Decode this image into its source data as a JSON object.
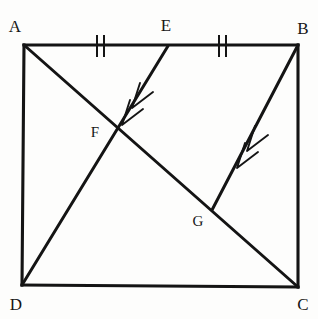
{
  "figure": {
    "type": "euclidean-geometry-diagram",
    "canvas": {
      "width": 318,
      "height": 319
    },
    "background_color": "#fdfdfc",
    "ink_color": "#141414",
    "vertices": [
      {
        "name": "A",
        "label": "A",
        "x": 24,
        "y": 45,
        "label_x": 15,
        "label_y": 32
      },
      {
        "name": "B",
        "label": "B",
        "x": 298,
        "y": 45,
        "label_x": 300,
        "label_y": 34
      },
      {
        "name": "C",
        "label": "C",
        "x": 298,
        "y": 287,
        "label_x": 299,
        "label_y": 309
      },
      {
        "name": "D",
        "label": "D",
        "x": 22,
        "y": 285,
        "label_x": 12,
        "label_y": 309
      }
    ],
    "points": [
      {
        "name": "E",
        "label": "E",
        "x": 168,
        "y": 46,
        "label_x": 161,
        "label_y": 31
      },
      {
        "name": "F",
        "label": "F",
        "x": 117,
        "y": 131,
        "label_x": 88,
        "label_y": 137
      },
      {
        "name": "G",
        "label": "G",
        "x": 212,
        "y": 210,
        "label_x": 191,
        "label_y": 225
      }
    ],
    "edges": [
      {
        "name": "side-AB",
        "from": "A",
        "to": "B",
        "x1": 24,
        "y1": 45,
        "x2": 298,
        "y2": 45
      },
      {
        "name": "side-BC",
        "from": "B",
        "to": "C",
        "x1": 298,
        "y1": 45,
        "x2": 298,
        "y2": 287
      },
      {
        "name": "side-CD",
        "from": "C",
        "to": "D",
        "x1": 298,
        "y1": 287,
        "x2": 22,
        "y2": 285
      },
      {
        "name": "side-DA",
        "from": "D",
        "to": "A",
        "x1": 22,
        "y1": 285,
        "x2": 24,
        "y2": 45
      }
    ],
    "diagonals": [
      {
        "name": "diagonal-AC",
        "from": "A",
        "to": "C",
        "x1": 24,
        "y1": 45,
        "x2": 298,
        "y2": 287
      }
    ],
    "cevians": [
      {
        "name": "segment-ED",
        "from": "E",
        "to": "D",
        "x1": 168,
        "y1": 46,
        "x2": 22,
        "y2": 285,
        "arrow_count": 2,
        "arrow_direction": "toward-D"
      },
      {
        "name": "segment-BG",
        "from": "B",
        "to": "G",
        "x1": 298,
        "y1": 45,
        "x2": 212,
        "y2": 210,
        "arrow_count": 2,
        "arrow_direction": "toward-G"
      }
    ],
    "congruence_marks": [
      {
        "name": "tick-on-AE",
        "segment": "AE",
        "count": 2,
        "x": 100,
        "y": 46,
        "spacing": 6,
        "half_height": 11
      },
      {
        "name": "tick-on-EB",
        "segment": "EB",
        "count": 2,
        "x": 222,
        "y": 46,
        "spacing": 6,
        "half_height": 11
      }
    ],
    "labels": {
      "A": "A",
      "B": "B",
      "C": "C",
      "D": "D",
      "E": "E",
      "F": "F",
      "G": "G"
    }
  }
}
